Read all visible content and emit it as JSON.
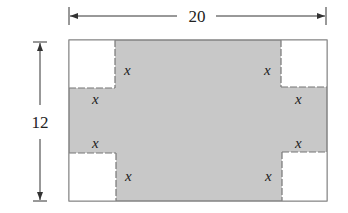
{
  "figure": {
    "type": "diagram",
    "colors": {
      "sheet_fill": "#c8c8c8",
      "corner_fill": "#ffffff",
      "outline": "#777777",
      "dimension_line": "#333333",
      "text": "#222222"
    },
    "width_dimension": {
      "label": "20"
    },
    "height_dimension": {
      "label": "12"
    },
    "corner_labels": {
      "top_left_vertical": "x",
      "top_left_horizontal": "x",
      "top_right_vertical": "x",
      "top_right_horizontal": "x",
      "bottom_left_horizontal": "x",
      "bottom_left_vertical": "x",
      "bottom_right_horizontal": "x",
      "bottom_right_vertical": "x"
    }
  }
}
